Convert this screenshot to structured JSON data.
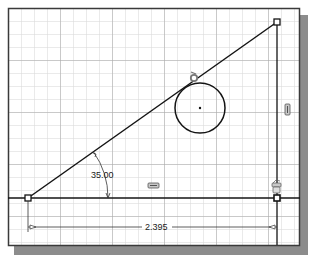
{
  "sketch": {
    "dimensions": {
      "angle_label": "35.00",
      "horizontal_label": "2.395"
    },
    "constraints": {
      "horizontal_icon": "horizontal-constraint-icon",
      "vertical_icon": "vertical-constraint-icon",
      "tangent_icon": "tangent-constraint-icon",
      "coincident_icon": "coincident-constraint-icon"
    },
    "colors": {
      "background": "#ffffff",
      "grid_minor": "#d4d4d4",
      "grid_major": "#a8a8a8",
      "geometry": "#141414",
      "frame": "#3a3a3a",
      "shadow": "#8c8c8c"
    }
  }
}
